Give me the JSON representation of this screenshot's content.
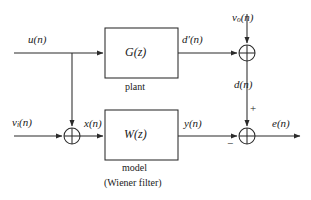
{
  "diagram": {
    "stroke_color": "#2b2b2b",
    "text_color": "#1a1a1a",
    "background": "#ffffff",
    "blocks": [
      {
        "id": "plant",
        "label": "G(z)",
        "caption": "plant",
        "x": 105,
        "y": 28,
        "w": 73,
        "h": 50
      },
      {
        "id": "model",
        "label": "W(z)",
        "caption": "model",
        "caption2": "(Wiener filter)",
        "x": 105,
        "y": 110,
        "w": 73,
        "h": 50
      }
    ],
    "summers": [
      {
        "id": "sum-input",
        "cx": 72,
        "cy": 136,
        "r": 8
      },
      {
        "id": "sum-desired",
        "cx": 247,
        "cy": 53,
        "r": 8
      },
      {
        "id": "sum-error",
        "cx": 247,
        "cy": 136,
        "r": 8
      }
    ],
    "signals": {
      "u": "u(n)",
      "nu_i_base": "ν",
      "nu_i_sub": "i",
      "nu_i_tail": "(n)",
      "nu_o_base": "ν",
      "nu_o_sub": "o",
      "nu_o_tail": "(n)",
      "x": "x(n)",
      "d_prime": "d′(n)",
      "d": "d(n)",
      "y": "y(n)",
      "e": "e(n)",
      "plus": "+",
      "minus": "−"
    }
  }
}
